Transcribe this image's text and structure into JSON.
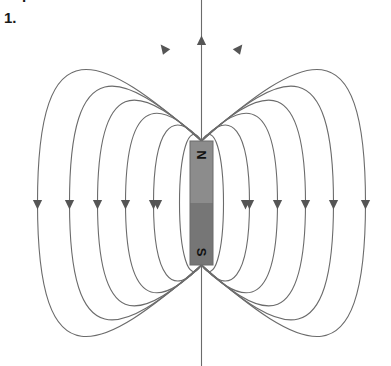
{
  "page": {
    "background_color": "#ffffff",
    "width": 391,
    "height": 366
  },
  "question": {
    "number_label": "1.",
    "clipped_text_above": "."
  },
  "figure": {
    "name": "bar-magnet-field-lines",
    "magnet": {
      "north_label": "N",
      "south_label": "S",
      "north_half_color": "#8c8c8c",
      "south_half_color": "#767676",
      "outline_color": "#6b6b6b",
      "x": 190,
      "y": 141,
      "width": 23,
      "height": 124
    },
    "field_lines": {
      "stroke_color": "#6b6b6b",
      "stroke_width": 1.1,
      "arrow_color": "#555555",
      "count_per_side": 6,
      "direction": "north-to-south"
    }
  },
  "chart_data": {
    "type": "diagram",
    "poles": [
      {
        "label": "N",
        "position": "top",
        "y_center": 155
      },
      {
        "label": "S",
        "position": "bottom",
        "y_center": 252
      }
    ],
    "magnet_geometry": {
      "center_x": 201.5,
      "top_y": 141,
      "bottom_y": 265,
      "width": 23,
      "height": 124
    },
    "loop_half_widths": [
      22,
      48,
      76,
      104,
      132,
      164
    ],
    "loop_half_heights": [
      66,
      104,
      142,
      180,
      218,
      262
    ],
    "arrow_rows": {
      "left_side_y": 205,
      "right_side_y": 205,
      "top_y": 40
    },
    "arrow_counts": {
      "left": 5,
      "right": 5,
      "top": 3
    }
  }
}
